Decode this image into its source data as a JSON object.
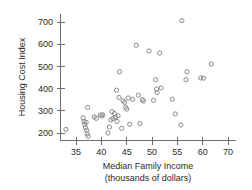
{
  "chart_data": {
    "type": "scatter",
    "title": "",
    "xlabel": "Median Family Income",
    "xlabel_sub": "(thousands of dollars)",
    "ylabel": "Housing Cost Index",
    "xlim": [
      32,
      71
    ],
    "ylim": [
      170,
      730
    ],
    "xticks": [
      35,
      40,
      45,
      50,
      55,
      60,
      70
    ],
    "yticks": [
      200,
      300,
      400,
      500,
      600,
      700
    ],
    "xtick_labels": [
      "35",
      "40",
      "45",
      "50",
      "55",
      "60",
      "70"
    ],
    "ytick_labels": [
      "200",
      "300",
      "400",
      "500",
      "600",
      "700"
    ],
    "grid": false,
    "legend": false,
    "marker": "open-circle",
    "marker_color": "#8a8a8a",
    "series": [
      {
        "name": "States",
        "points": [
          [
            33.0,
            216
          ],
          [
            36.4,
            268
          ],
          [
            36.6,
            252
          ],
          [
            36.7,
            238
          ],
          [
            36.9,
            224
          ],
          [
            37.0,
            248
          ],
          [
            37.1,
            213
          ],
          [
            37.2,
            196
          ],
          [
            37.3,
            315
          ],
          [
            37.4,
            186
          ],
          [
            38.6,
            272
          ],
          [
            39.0,
            266
          ],
          [
            39.8,
            281
          ],
          [
            40.1,
            277
          ],
          [
            40.3,
            282
          ],
          [
            41.3,
            200
          ],
          [
            41.6,
            227
          ],
          [
            41.9,
            259
          ],
          [
            42.1,
            296
          ],
          [
            42.3,
            265
          ],
          [
            42.6,
            288
          ],
          [
            42.8,
            271
          ],
          [
            43.0,
            393
          ],
          [
            43.1,
            252
          ],
          [
            43.3,
            278
          ],
          [
            43.5,
            360
          ],
          [
            43.6,
            476
          ],
          [
            44.0,
            221
          ],
          [
            44.3,
            345
          ],
          [
            44.6,
            338
          ],
          [
            44.8,
            316
          ],
          [
            45.0,
            308
          ],
          [
            45.3,
            358
          ],
          [
            45.6,
            239
          ],
          [
            46.2,
            352
          ],
          [
            46.9,
            595
          ],
          [
            47.3,
            370
          ],
          [
            47.6,
            243
          ],
          [
            48.1,
            350
          ],
          [
            48.3,
            344
          ],
          [
            49.4,
            570
          ],
          [
            50.3,
            347
          ],
          [
            50.7,
            440
          ],
          [
            50.9,
            398
          ],
          [
            51.0,
            382
          ],
          [
            51.5,
            560
          ],
          [
            51.8,
            403
          ],
          [
            54.0,
            352
          ],
          [
            54.6,
            286
          ],
          [
            55.7,
            236
          ],
          [
            55.9,
            706
          ],
          [
            56.7,
            440
          ],
          [
            56.9,
            476
          ],
          [
            59.6,
            448
          ],
          [
            60.3,
            447
          ],
          [
            63.4,
            511
          ]
        ]
      }
    ]
  }
}
